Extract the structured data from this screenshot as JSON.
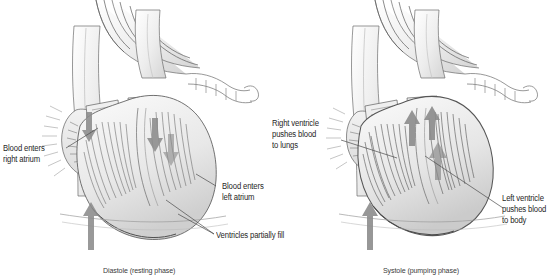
{
  "figure": {
    "background_color": "#ffffff",
    "ink_color": "#3a3a3a",
    "text_color": "#262626",
    "arrow_color": "#8c8c8c"
  },
  "panels": [
    {
      "id": "diastole",
      "side": "left",
      "caption": "Diastole (resting phase)",
      "labels": [
        {
          "name": "blood-enters-right-atrium",
          "text": "Blood enters\nright atrium"
        },
        {
          "name": "blood-enters-left-atrium",
          "text": "Blood enters\nleft atrium"
        },
        {
          "name": "ventricles-partially-fill",
          "text": "Ventricles partially fill"
        }
      ],
      "flow_arrows": [
        {
          "name": "inferior-vena-cava-inflow-arrow",
          "direction": "up"
        },
        {
          "name": "right-atrium-inflow-arrow",
          "direction": "down"
        },
        {
          "name": "left-atrium-inflow-arrow",
          "direction": "down"
        },
        {
          "name": "ventricle-filling-arrow",
          "direction": "down"
        }
      ]
    },
    {
      "id": "systole",
      "side": "right",
      "caption": "Systole (pumping phase)",
      "labels": [
        {
          "name": "right-ventricle-pushes-blood-to-lungs",
          "text": "Right ventricle\npushes blood\nto lungs"
        },
        {
          "name": "left-ventricle-pushes-blood-to-body",
          "text": "Left ventricle\npushes blood\nto body"
        }
      ],
      "flow_arrows": [
        {
          "name": "inferior-vena-cava-inflow-arrow",
          "direction": "up"
        },
        {
          "name": "pulmonary-outflow-arrow",
          "direction": "up"
        },
        {
          "name": "aortic-outflow-arrow",
          "direction": "up"
        },
        {
          "name": "left-ventricle-ejection-arrow",
          "direction": "up"
        }
      ]
    }
  ],
  "labels": {
    "blood_enters_right_atrium": "Blood enters\nright atrium",
    "blood_enters_left_atrium": "Blood enters\nleft atrium",
    "ventricles_partially_fill": "Ventricles partially fill",
    "right_ventricle_pushes": "Right ventricle\npushes blood\nto lungs",
    "left_ventricle_pushes": "Left ventricle\npushes blood\nto body"
  },
  "captions": {
    "left": "Diastole (resting phase)",
    "right": "Systole (pumping phase)"
  }
}
